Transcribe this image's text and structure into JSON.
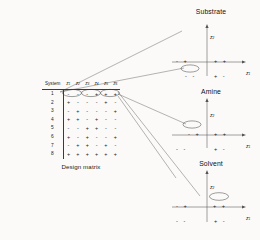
{
  "figure": {
    "caption": "Design matrix",
    "table": {
      "header_system": "System",
      "header_factors": [
        "z",
        "z",
        "z",
        "z",
        "z",
        "z"
      ],
      "header_subscripts": [
        "1",
        "2",
        "3",
        "4",
        "5",
        "6"
      ],
      "rows": [
        {
          "system": "1",
          "signs": [
            "-",
            "-",
            "-",
            "+",
            "+",
            "+"
          ]
        },
        {
          "system": "2",
          "signs": [
            "+",
            "-",
            "-",
            "-",
            "+",
            "-"
          ]
        },
        {
          "system": "3",
          "signs": [
            "-",
            "+",
            "-",
            "-",
            "-",
            "+"
          ]
        },
        {
          "system": "4",
          "signs": [
            "+",
            "+",
            "-",
            "+",
            "-",
            "-"
          ]
        },
        {
          "system": "5",
          "signs": [
            "-",
            "-",
            "+",
            "+",
            "-",
            "-"
          ]
        },
        {
          "system": "6",
          "signs": [
            "+",
            "-",
            "+",
            "-",
            "-",
            "+"
          ]
        },
        {
          "system": "7",
          "signs": [
            "-",
            "+",
            "+",
            "-",
            "+",
            "-"
          ]
        },
        {
          "system": "8",
          "signs": [
            "+",
            "+",
            "+",
            "+",
            "+",
            "+"
          ]
        }
      ],
      "highlighted_pairs": [
        {
          "columns": "z1-z2",
          "row": "1"
        },
        {
          "columns": "z3-z4",
          "row": "1"
        },
        {
          "columns": "z5-z6",
          "row": "1"
        }
      ]
    },
    "plots": [
      {
        "title": "Substrate",
        "y_axis": "z",
        "y_sub": "2",
        "x_axis": "z",
        "x_sub": "1",
        "quadrants": {
          "upper_left": "-  +",
          "upper_right": "+  +",
          "lower_left": "-  -",
          "lower_right": "+  -"
        },
        "highlighted_quadrant": "lower_left"
      },
      {
        "title": "Amine",
        "y_axis": "z",
        "y_sub": "2",
        "x_axis": "z",
        "x_sub": "1",
        "quadrants": {
          "upper_left": "-  +",
          "upper_right": "+  +",
          "lower_left": "-  -",
          "lower_right": "+  -"
        },
        "highlighted_quadrant": "upper_left"
      },
      {
        "title": "Solvent",
        "y_axis": "z",
        "y_sub": "2",
        "x_axis": "z",
        "x_sub": "1",
        "quadrants": {
          "upper_left": "-  +",
          "upper_right": "+  +",
          "lower_left": "-  -",
          "lower_right": "+  -"
        },
        "highlighted_quadrant": "upper_right"
      }
    ],
    "colors": {
      "line": "#4a4a4a",
      "text": "#1a1a1a",
      "background": "#fbfaf8"
    }
  }
}
